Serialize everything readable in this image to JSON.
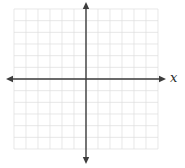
{
  "chart_data": {
    "type": "line",
    "subtype": "empty-coordinate-plane",
    "title": "",
    "xlabel": "x",
    "ylabel": "",
    "xlim": [
      -6,
      6
    ],
    "ylim": [
      -6,
      6
    ],
    "grid": true,
    "grid_divisions_x": 12,
    "grid_divisions_y": 12,
    "tick_labels_shown": false,
    "series": [],
    "annotations": []
  },
  "labels": {
    "x_axis": "x"
  },
  "colors": {
    "background": "#ffffff",
    "grid_line": "#dedede",
    "axis_line": "#3d3d3d",
    "label_text": "#2b2b2b"
  }
}
